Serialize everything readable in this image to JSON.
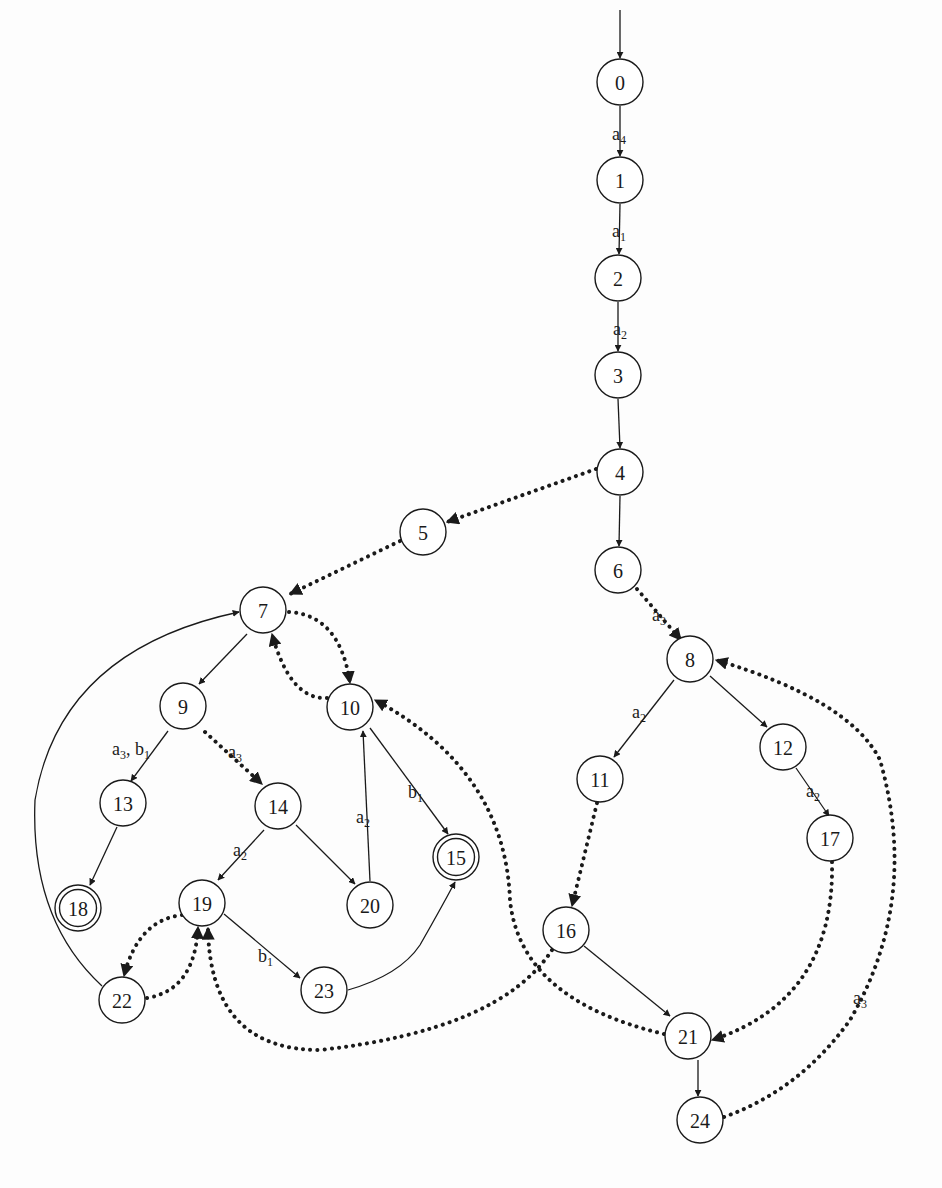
{
  "diagram": {
    "type": "state-transition-graph",
    "initial_state": "0",
    "accepting_states": [
      "15",
      "18"
    ],
    "nodes": [
      {
        "id": "0",
        "label": "0",
        "x": 620,
        "y": 82,
        "accepting": false
      },
      {
        "id": "1",
        "label": "1",
        "x": 620,
        "y": 180,
        "accepting": false
      },
      {
        "id": "2",
        "label": "2",
        "x": 618,
        "y": 278,
        "accepting": false
      },
      {
        "id": "3",
        "label": "3",
        "x": 618,
        "y": 375,
        "accepting": false
      },
      {
        "id": "4",
        "label": "4",
        "x": 620,
        "y": 472,
        "accepting": false
      },
      {
        "id": "5",
        "label": "5",
        "x": 423,
        "y": 532,
        "accepting": false
      },
      {
        "id": "6",
        "label": "6",
        "x": 618,
        "y": 570,
        "accepting": false
      },
      {
        "id": "7",
        "label": "7",
        "x": 263,
        "y": 610,
        "accepting": false
      },
      {
        "id": "8",
        "label": "8",
        "x": 690,
        "y": 659,
        "accepting": false
      },
      {
        "id": "9",
        "label": "9",
        "x": 183,
        "y": 706,
        "accepting": false
      },
      {
        "id": "10",
        "label": "10",
        "x": 350,
        "y": 707,
        "accepting": false
      },
      {
        "id": "11",
        "label": "11",
        "x": 600,
        "y": 779,
        "accepting": false
      },
      {
        "id": "12",
        "label": "12",
        "x": 783,
        "y": 747,
        "accepting": false
      },
      {
        "id": "13",
        "label": "13",
        "x": 123,
        "y": 803,
        "accepting": false
      },
      {
        "id": "14",
        "label": "14",
        "x": 278,
        "y": 806,
        "accepting": false
      },
      {
        "id": "15",
        "label": "15",
        "x": 456,
        "y": 857,
        "accepting": true
      },
      {
        "id": "16",
        "label": "16",
        "x": 566,
        "y": 930,
        "accepting": false
      },
      {
        "id": "17",
        "label": "17",
        "x": 830,
        "y": 838,
        "accepting": false
      },
      {
        "id": "18",
        "label": "18",
        "x": 78,
        "y": 908,
        "accepting": true
      },
      {
        "id": "19",
        "label": "19",
        "x": 202,
        "y": 903,
        "accepting": false
      },
      {
        "id": "20",
        "label": "20",
        "x": 370,
        "y": 905,
        "accepting": false
      },
      {
        "id": "21",
        "label": "21",
        "x": 688,
        "y": 1036,
        "accepting": false
      },
      {
        "id": "22",
        "label": "22",
        "x": 122,
        "y": 1000,
        "accepting": false
      },
      {
        "id": "23",
        "label": "23",
        "x": 324,
        "y": 990,
        "accepting": false
      },
      {
        "id": "24",
        "label": "24",
        "x": 700,
        "y": 1120,
        "accepting": false
      }
    ],
    "edges": [
      {
        "from": "start",
        "to": "0",
        "style": "solid",
        "label": "",
        "path": "M620 10 L620 58"
      },
      {
        "from": "0",
        "to": "1",
        "style": "solid",
        "label": "a4",
        "label_base": "a",
        "label_sub": "4",
        "lx": 612,
        "ly": 140,
        "path": "M620 106 L620 156"
      },
      {
        "from": "1",
        "to": "2",
        "style": "solid",
        "label": "a1",
        "label_base": "a",
        "label_sub": "1",
        "lx": 612,
        "ly": 237,
        "path": "M620 204 L619 254"
      },
      {
        "from": "2",
        "to": "3",
        "style": "solid",
        "label": "a2",
        "label_base": "a",
        "label_sub": "2",
        "lx": 613,
        "ly": 335,
        "path": "M618 302 L618 351"
      },
      {
        "from": "3",
        "to": "4",
        "style": "solid",
        "label": "",
        "path": "M618 399 L620 448"
      },
      {
        "from": "4",
        "to": "5",
        "style": "dotted",
        "label": "",
        "path": "M596 469 L447 522"
      },
      {
        "from": "4",
        "to": "6",
        "style": "solid",
        "label": "",
        "path": "M620 496 L619 546"
      },
      {
        "from": "5",
        "to": "7",
        "style": "dotted",
        "label": "",
        "path": "M400 541 L290 594"
      },
      {
        "from": "6",
        "to": "8",
        "style": "dotted",
        "label": "a3",
        "label_base": "a",
        "label_sub": "3",
        "lx": 652,
        "ly": 621,
        "path": "M637 589 L681 640"
      },
      {
        "from": "7",
        "to": "10",
        "style": "dotted",
        "label": "",
        "path": "M289 612 Q340 615 350 683"
      },
      {
        "from": "10",
        "to": "7",
        "style": "dotted",
        "label": "",
        "path": "M327 698 Q290 700 272 634"
      },
      {
        "from": "7",
        "to": "9",
        "style": "solid",
        "label": "",
        "path": "M247 634 L199 684"
      },
      {
        "from": "9",
        "to": "13",
        "style": "solid",
        "label": "a3, b1",
        "label_base": "a3, b1",
        "lx": 112,
        "ly": 755,
        "path": "M168 731 L131 781"
      },
      {
        "from": "9",
        "to": "14",
        "style": "dotted",
        "label": "a3",
        "label_base": "a",
        "label_sub": "3",
        "lx": 228,
        "ly": 758,
        "path": "M205 732 L262 784"
      },
      {
        "from": "10",
        "to": "15",
        "style": "solid",
        "label": "b1",
        "label_base": "b",
        "label_sub": "1",
        "lx": 408,
        "ly": 798,
        "path": "M370 728 L448 834"
      },
      {
        "from": "20",
        "to": "10",
        "style": "solid",
        "label": "a2",
        "label_base": "a",
        "label_sub": "2",
        "lx": 356,
        "ly": 823,
        "path": "M370 881 L363 731"
      },
      {
        "from": "14",
        "to": "20",
        "style": "solid",
        "label": "",
        "path": "M296 825 L355 884"
      },
      {
        "from": "14",
        "to": "19",
        "style": "solid",
        "label": "a2",
        "label_base": "a",
        "label_sub": "2",
        "lx": 233,
        "ly": 856,
        "path": "M264 830 L218 880"
      },
      {
        "from": "13",
        "to": "18",
        "style": "solid",
        "label": "",
        "path": "M117 827 L90 885"
      },
      {
        "from": "19",
        "to": "22",
        "style": "dotted",
        "label": "",
        "path": "M182 915 Q138 920 124 976"
      },
      {
        "from": "22",
        "to": "19",
        "style": "dotted",
        "label": "",
        "path": "M147 998 Q195 990 198 927"
      },
      {
        "from": "22",
        "to": "7",
        "style": "solid",
        "label": "",
        "path": "M102 986 Q30 920 35 800 Q60 650 239 612"
      },
      {
        "from": "19",
        "to": "23",
        "style": "solid",
        "label": "b1",
        "label_base": "b",
        "label_sub": "1",
        "lx": 258,
        "ly": 962,
        "path": "M224 914 L300 978"
      },
      {
        "from": "23",
        "to": "15",
        "style": "solid",
        "label": "",
        "path": "M348 990 Q400 975 420 945 Q440 910 455 882"
      },
      {
        "from": "16",
        "to": "19",
        "style": "dotted",
        "label": "",
        "path": "M552 950 Q500 1030 320 1050 Q210 1050 208 928"
      },
      {
        "from": "8",
        "to": "11",
        "style": "solid",
        "label": "a2",
        "label_base": "a",
        "label_sub": "2",
        "lx": 632,
        "ly": 718,
        "path": "M674 680 L614 757"
      },
      {
        "from": "8",
        "to": "12",
        "style": "solid",
        "label": "",
        "path": "M710 676 L767 727"
      },
      {
        "from": "12",
        "to": "17",
        "style": "solid",
        "label": "a2",
        "label_base": "a",
        "label_sub": "2",
        "lx": 806,
        "ly": 797,
        "path": "M796 768 L829 816"
      },
      {
        "from": "11",
        "to": "16",
        "style": "dotted",
        "label": "",
        "path": "M597 803 L572 906"
      },
      {
        "from": "16",
        "to": "21",
        "style": "solid",
        "label": "",
        "path": "M584 946 L670 1016"
      },
      {
        "from": "17",
        "to": "21",
        "style": "dotted",
        "label": "",
        "path": "M832 862 Q835 1000 712 1040"
      },
      {
        "from": "21",
        "to": "10",
        "style": "dotted",
        "label": "",
        "path": "M664 1034 Q520 1000 510 900 Q505 770 375 700"
      },
      {
        "from": "21",
        "to": "24",
        "style": "solid",
        "label": "",
        "path": "M698 1060 L698 1096"
      },
      {
        "from": "24",
        "to": "8",
        "style": "dotted",
        "label": "a3",
        "label_base": "a",
        "label_sub": "3",
        "lx": 853,
        "ly": 1004,
        "path": "M724 1117 Q800 1090 850 1020 Q920 900 880 760 Q850 700 716 660"
      }
    ]
  }
}
